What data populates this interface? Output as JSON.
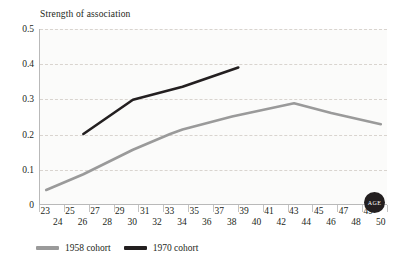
{
  "chart_data": {
    "type": "line",
    "title": "Strength of association",
    "xlabel": "AGE",
    "ylabel": "",
    "xlim": [
      22.5,
      50.5
    ],
    "ylim": [
      0,
      0.5
    ],
    "grid": true,
    "legend_position": "bottom-left",
    "y_ticks": [
      "0.5",
      "0.4",
      "0.3",
      "0.2",
      "0.1",
      "0"
    ],
    "y_tick_values": [
      0.5,
      0.4,
      0.3,
      0.2,
      0.1,
      0
    ],
    "x_ticks_top": [
      "23",
      "25",
      "27",
      "29",
      "31",
      "33",
      "35",
      "37",
      "39",
      "41",
      "43",
      "45",
      "47",
      "49"
    ],
    "x_ticks_bottom": [
      "24",
      "26",
      "28",
      "30",
      "32",
      "34",
      "36",
      "38",
      "40",
      "42",
      "44",
      "46",
      "48",
      "50"
    ],
    "x_tick_values_top": [
      23,
      25,
      27,
      29,
      31,
      33,
      35,
      37,
      39,
      41,
      43,
      45,
      47,
      49
    ],
    "x_tick_values_bottom": [
      24,
      26,
      28,
      30,
      32,
      34,
      36,
      38,
      40,
      42,
      44,
      46,
      48,
      50
    ],
    "series": [
      {
        "name": "1958 cohort",
        "color": "#9a9a9a",
        "x": [
          23,
          26,
          30,
          33,
          34,
          38,
          43,
          46,
          50
        ],
        "values": [
          0.04,
          0.085,
          0.155,
          0.2,
          0.213,
          0.25,
          0.288,
          0.26,
          0.228
        ]
      },
      {
        "name": "1970 cohort",
        "color": "#231f20",
        "x": [
          26,
          30,
          34,
          38.5
        ],
        "values": [
          0.2,
          0.298,
          0.335,
          0.39
        ]
      }
    ],
    "legend": [
      {
        "label": "1958 cohort",
        "color": "#9a9a9a"
      },
      {
        "label": "1970 cohort",
        "color": "#231f20"
      }
    ],
    "age_badge": "AGE"
  },
  "colors": {
    "background": "#ffffff",
    "plot_background": "#fbfbfa",
    "axis": "#b9b9b9",
    "gridline": "#d9d4cf",
    "text": "#231f20",
    "series_1958": "#9a9a9a",
    "series_1970": "#231f20",
    "badge_background": "#231f20",
    "badge_text": "#ffffff"
  }
}
